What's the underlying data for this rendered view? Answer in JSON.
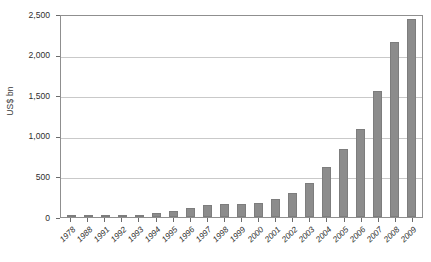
{
  "chart_data": {
    "type": "bar",
    "title": "",
    "subtitle": "",
    "xlabel": "",
    "ylabel": "US$ bn",
    "ylim": [
      0,
      2500
    ],
    "y_ticks": [
      0,
      500,
      1000,
      1500,
      2000,
      2500
    ],
    "y_tick_labels": [
      "0",
      "500",
      "1,000",
      "1,500",
      "2,000",
      "2,500"
    ],
    "grid": true,
    "legend": null,
    "bar_color": "#8c8c8c",
    "categories": [
      "1978",
      "1988",
      "1991",
      "1992",
      "1993",
      "1994",
      "1995",
      "1996",
      "1997",
      "1998",
      "1999",
      "2000",
      "2001",
      "2002",
      "2003",
      "2004",
      "2005",
      "2006",
      "2007",
      "2008",
      "2009"
    ],
    "values": [
      2,
      3,
      20,
      12,
      22,
      50,
      80,
      110,
      150,
      155,
      160,
      175,
      225,
      300,
      425,
      620,
      840,
      1090,
      1555,
      2160,
      2440
    ]
  }
}
